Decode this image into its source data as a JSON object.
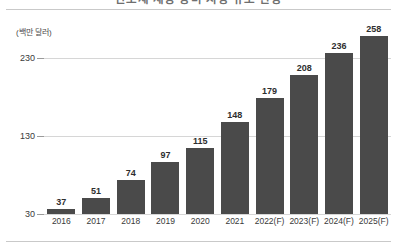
{
  "figure": {
    "title": "반도체 세정 장비 시장 규모 전망",
    "unit_label": "(백만 달러)"
  },
  "chart_data": {
    "type": "bar",
    "title": "반도체 세정 장비 시장 규모 전망",
    "xlabel": "",
    "ylabel": "(백만 달러)",
    "ylim": [
      30,
      258
    ],
    "yticks": [
      30,
      130,
      230
    ],
    "ytick_labels": [
      "30",
      "130",
      "230"
    ],
    "grid": true,
    "legend": "none",
    "bar_color": "#4a4a4a",
    "categories": [
      "2016",
      "2017",
      "2018",
      "2019",
      "2020",
      "2021",
      "2022(F)",
      "2023(F)",
      "2024(F)",
      "2025(F)"
    ],
    "values": [
      37,
      51,
      74,
      97,
      115,
      148,
      179,
      208,
      236,
      258
    ],
    "value_labels": [
      "37",
      "51",
      "74",
      "97",
      "115",
      "148",
      "179",
      "208",
      "236",
      "258"
    ]
  }
}
